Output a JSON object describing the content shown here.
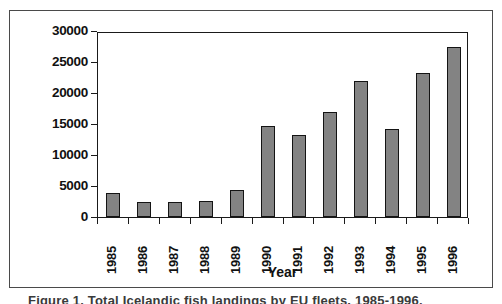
{
  "figure": {
    "caption": "Figure 1. Total Icelandic fish landings by EU fleets, 1985-1996."
  },
  "chart_data": {
    "type": "bar",
    "title": "",
    "xlabel": "Year",
    "ylabel": "Landings (t)",
    "categories": [
      "1985",
      "1986",
      "1987",
      "1988",
      "1989",
      "1990",
      "1991",
      "1992",
      "1993",
      "1994",
      "1995",
      "1996"
    ],
    "values": [
      3900,
      2500,
      2500,
      2600,
      4300,
      14700,
      13200,
      17000,
      22000,
      14200,
      23200,
      27400
    ],
    "ylim": [
      0,
      30000
    ],
    "y_ticks": [
      0,
      5000,
      10000,
      15000,
      20000,
      25000,
      30000
    ],
    "y_tick_labels": [
      "0",
      "5000",
      "10000",
      "15000",
      "20000",
      "25000",
      "30000"
    ],
    "grid": false,
    "legend": false,
    "bar_color": "#838383",
    "bar_border_color": "#141414",
    "axis_color": "#1a1a1a",
    "background": "#ffffff"
  }
}
